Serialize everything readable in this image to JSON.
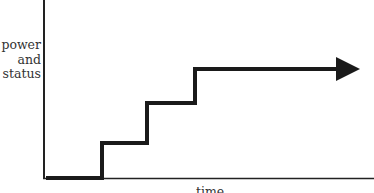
{
  "diagram": {
    "y_axis_label_lines": [
      "power",
      "and",
      "status"
    ],
    "x_axis_label": "time",
    "colors": {
      "axis": "#222222",
      "line": "#1a1a1a",
      "text": "#333333",
      "background": "#ffffff"
    },
    "step_line": {
      "description": "staircase rising in three steps, ending with a rightward arrow",
      "points": [
        [
          46,
          178
        ],
        [
          102,
          178
        ],
        [
          102,
          143
        ],
        [
          147,
          143
        ],
        [
          147,
          103
        ],
        [
          195,
          103
        ],
        [
          195,
          69
        ],
        [
          345,
          69
        ]
      ]
    }
  }
}
